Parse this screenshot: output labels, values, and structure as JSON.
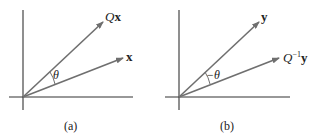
{
  "panels": [
    {
      "caption": "(a)",
      "vectors": [
        {
          "label_prefix": "Q",
          "label_main": "x",
          "label_sup": ""
        },
        {
          "label_prefix": "",
          "label_main": "x",
          "label_sup": ""
        }
      ],
      "angle_label": "θ"
    },
    {
      "caption": "(b)",
      "vectors": [
        {
          "label_prefix": "",
          "label_main": "y",
          "label_sup": ""
        },
        {
          "label_prefix": "Q",
          "label_main": "y",
          "label_sup": "−1"
        }
      ],
      "angle_label": "−θ"
    }
  ],
  "colors": {
    "line": "#6f6f6f",
    "axis": "#333333",
    "text": "#222222"
  }
}
